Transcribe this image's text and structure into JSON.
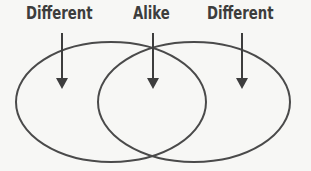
{
  "diagram": {
    "type": "venn",
    "labels": {
      "left": "Different",
      "center": "Alike",
      "right": "Different"
    },
    "colors": {
      "stroke": "#3d3d3d",
      "background": "#f7f7f5"
    }
  }
}
